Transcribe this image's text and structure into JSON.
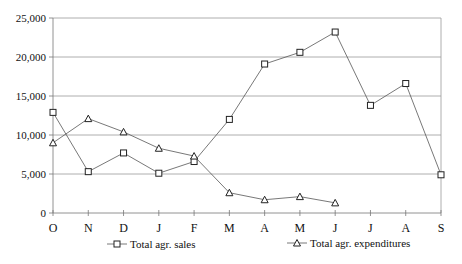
{
  "chart_data": {
    "type": "line",
    "title": "",
    "xlabel": "",
    "ylabel": "",
    "categories": [
      "O",
      "N",
      "D",
      "J",
      "F",
      "M",
      "A",
      "M",
      "J",
      "J",
      "A",
      "S"
    ],
    "ylim": [
      0,
      25000
    ],
    "yticks": [
      0,
      5000,
      10000,
      15000,
      20000,
      25000
    ],
    "ytick_labels": [
      "0",
      "5,000",
      "10,000",
      "15,000",
      "20,000",
      "25,000"
    ],
    "grid": true,
    "legend_position": "bottom",
    "series": [
      {
        "name": "Total agr. sales",
        "marker": "square",
        "values": [
          12900,
          5300,
          7700,
          5100,
          6600,
          12000,
          19100,
          20600,
          23200,
          13800,
          16600,
          4900
        ]
      },
      {
        "name": "Total agr. expenditures",
        "marker": "triangle",
        "values": [
          9000,
          12100,
          10400,
          8300,
          7300,
          2600,
          1700,
          2100,
          1300,
          null,
          null,
          null
        ]
      }
    ]
  }
}
